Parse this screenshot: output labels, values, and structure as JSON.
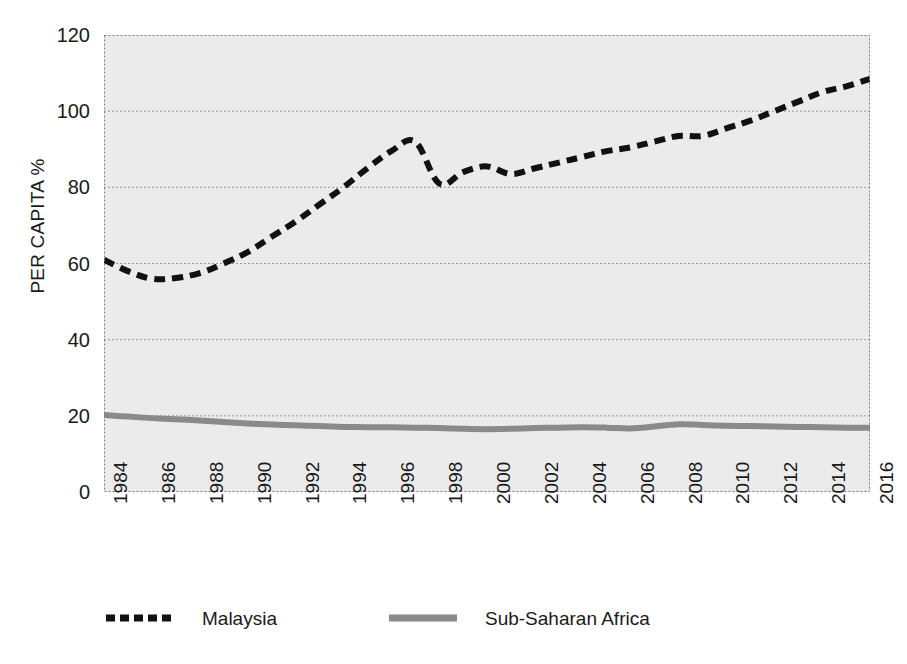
{
  "chart_data": {
    "type": "line",
    "title": "",
    "subtitle": "",
    "xlabel": "",
    "ylabel": "PER CAPITA %",
    "ylim": [
      0,
      120
    ],
    "ytick_step": 20,
    "ytick_labels": [
      "120",
      "100",
      "80",
      "60",
      "40",
      "20",
      "0"
    ],
    "ytick_values": [
      120,
      100,
      80,
      60,
      40,
      20,
      0
    ],
    "xlim": [
      1984,
      2016
    ],
    "xtick_labels": [
      "1984",
      "1986",
      "1988",
      "1990",
      "1992",
      "1994",
      "1996",
      "1998",
      "2000",
      "2002",
      "2004",
      "2006",
      "2008",
      "2010",
      "2012",
      "2014",
      "2016"
    ],
    "xtick_values": [
      1984,
      1986,
      1988,
      1990,
      1992,
      1994,
      1996,
      1998,
      2000,
      2002,
      2004,
      2006,
      2008,
      2010,
      2012,
      2014,
      2016
    ],
    "grid": true,
    "grid_axis": "y",
    "grid_style": "dotted",
    "legend_position": "bottom",
    "plot_background": "#ebebeb",
    "x": [
      1984,
      1985,
      1986,
      1987,
      1988,
      1989,
      1990,
      1991,
      1992,
      1993,
      1994,
      1995,
      1996,
      1997,
      1998,
      1999,
      2000,
      2001,
      2002,
      2003,
      2004,
      2005,
      2006,
      2007,
      2008,
      2009,
      2010,
      2011,
      2012,
      2013,
      2014,
      2015,
      2016
    ],
    "series": [
      {
        "name": "Malaysia",
        "color": "#111111",
        "style": "dashed",
        "width": 6,
        "values": [
          61.0,
          58.0,
          56.0,
          56.2,
          57.5,
          60.0,
          63.0,
          67.0,
          71.0,
          75.5,
          80.0,
          85.0,
          89.5,
          92.0,
          81.0,
          84.0,
          85.5,
          83.5,
          85.0,
          86.5,
          88.0,
          89.5,
          90.5,
          92.0,
          93.5,
          93.5,
          95.5,
          97.5,
          100.0,
          102.5,
          105.0,
          106.5,
          108.5
        ]
      },
      {
        "name": "Sub-Saharan Africa",
        "color": "#8a8a8a",
        "style": "solid",
        "width": 6,
        "values": [
          20.2,
          19.8,
          19.4,
          19.1,
          18.8,
          18.4,
          18.0,
          17.7,
          17.5,
          17.3,
          17.1,
          17.0,
          17.0,
          16.9,
          16.8,
          16.6,
          16.5,
          16.6,
          16.8,
          16.9,
          17.0,
          16.9,
          16.7,
          17.2,
          17.8,
          17.6,
          17.4,
          17.3,
          17.2,
          17.1,
          17.0,
          16.9,
          16.9
        ]
      }
    ]
  },
  "legend": {
    "entries": [
      {
        "label": "Malaysia",
        "swatch": "dashed-black-line"
      },
      {
        "label": "Sub-Saharan Africa",
        "swatch": "solid-gray-line"
      }
    ]
  },
  "colors": {
    "malaysia": "#111111",
    "sub_saharan_africa": "#8a8a8a",
    "plot_background": "#ebebeb",
    "page_background": "#ffffff",
    "gridline": "#9a9a9a",
    "text": "#1a1a1a"
  }
}
